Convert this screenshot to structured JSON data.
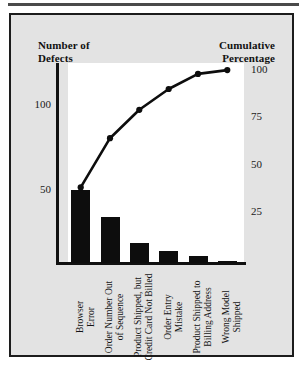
{
  "figure": {
    "left_axis_title": "Number of\nDefects",
    "left_axis_title_line1": "Number of",
    "left_axis_title_line2": "Defects",
    "right_axis_title_line1": "Cumulative",
    "right_axis_title_line2": "Percentage"
  },
  "chart_data": {
    "type": "bar",
    "title": "",
    "subtitle": "",
    "xlabel": "",
    "ylabel": "Number of Defects",
    "y2label": "Cumulative Percentage",
    "grid": false,
    "legend": "none",
    "categories": [
      "Browser Error",
      "Order Number Out of Sequence",
      "Product Shipped, but Credit Card Not Billed",
      "Order Entry Mistake",
      "Product Shipped to Billing Address",
      "Wrong Model Shipped"
    ],
    "category_lines": [
      [
        "Browser",
        "Error"
      ],
      [
        "Order Number Out",
        "of Sequence"
      ],
      [
        "Product Shipped, but",
        "Credit Card Not Billed"
      ],
      [
        "Order Entry",
        "Mistake"
      ],
      [
        "Product Shipped to",
        "Billing Address"
      ],
      [
        "Wrong Model",
        "Shipped"
      ]
    ],
    "series": [
      {
        "name": "Number of Defects",
        "type": "bar",
        "axis": "left",
        "values": [
          50,
          34,
          19,
          14,
          11,
          4
        ]
      },
      {
        "name": "Cumulative Percentage",
        "type": "line",
        "axis": "right",
        "values": [
          38,
          64,
          79,
          90,
          98,
          100
        ]
      }
    ],
    "ylim": [
      0,
      150
    ],
    "yticks": [
      50,
      100
    ],
    "ytick_labels": [
      "50",
      "100"
    ],
    "y2lim": [
      0,
      105
    ],
    "y2ticks": [
      25,
      50,
      75,
      100
    ],
    "y2tick_labels": [
      "25",
      "50",
      "75",
      "100"
    ],
    "colors": {
      "bar": "#0d0d0d",
      "line": "#0d0d0d",
      "plot_background": "#ffffff",
      "figure_background": "#e3e3e3",
      "border": "#1c1c1c",
      "text": "#141414"
    }
  }
}
